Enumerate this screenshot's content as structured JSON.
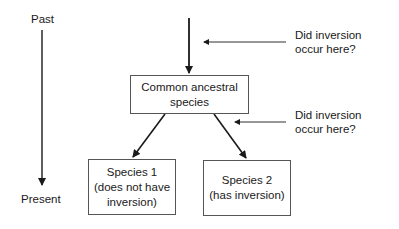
{
  "timeline": {
    "start_label": "Past",
    "end_label": "Present"
  },
  "nodes": {
    "ancestor": "Common ancestral\nspecies",
    "species1": "Species 1\n(does not have\ninversion)",
    "species2": "Species 2\n(has inversion)"
  },
  "questions": [
    {
      "text": "Did inversion\noccur here?"
    },
    {
      "text": "Did inversion\noccur here?"
    }
  ],
  "colors": {
    "line": "#1a1a1a",
    "box_border": "#555555"
  }
}
